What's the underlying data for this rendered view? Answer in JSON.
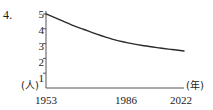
{
  "figure": {
    "item_number": "4.",
    "y_unit_label": "(人)",
    "x_unit_label": "(年)"
  },
  "chart_data": {
    "type": "line",
    "title": "",
    "xlabel": "(年)",
    "ylabel": "(人)",
    "x": [
      1953,
      1986,
      2022
    ],
    "xlim": [
      1953,
      2022
    ],
    "ylim": [
      0,
      5.2
    ],
    "grid": false,
    "legend": null,
    "x_tick_labels": [
      "1953",
      "1986",
      "2022"
    ],
    "y_tick_labels": [
      "1",
      "2",
      "3",
      "4",
      "5"
    ],
    "y_ticks": [
      1,
      2,
      3,
      4,
      5
    ],
    "series": [
      {
        "name": "世帯人員",
        "color": "#2b2b2b",
        "points": [
          {
            "year": 1953,
            "value": 5.0
          },
          {
            "year": 1960,
            "value": 4.6
          },
          {
            "year": 1966,
            "value": 4.25
          },
          {
            "year": 1972,
            "value": 3.95
          },
          {
            "year": 1978,
            "value": 3.65
          },
          {
            "year": 1986,
            "value": 3.3
          },
          {
            "year": 1994,
            "value": 3.05
          },
          {
            "year": 2002,
            "value": 2.85
          },
          {
            "year": 2010,
            "value": 2.7
          },
          {
            "year": 2016,
            "value": 2.6
          },
          {
            "year": 2022,
            "value": 2.5
          }
        ]
      }
    ]
  }
}
